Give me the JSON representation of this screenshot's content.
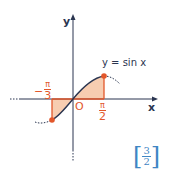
{
  "diagram": {
    "axis_x_label": "x",
    "axis_y_label": "y",
    "origin_label": "O",
    "curve_label": "y = sin x",
    "left_bound": {
      "sign": "−",
      "numerator": "π",
      "denominator": "3"
    },
    "right_bound": {
      "numerator": "π",
      "denominator": "2"
    },
    "answer": {
      "numerator": "3",
      "denominator": "2"
    },
    "colors": {
      "curve": "#2a3550",
      "accent": "#e2572b",
      "fill": "#f7cdb1",
      "answer": "#3f86c4"
    }
  }
}
